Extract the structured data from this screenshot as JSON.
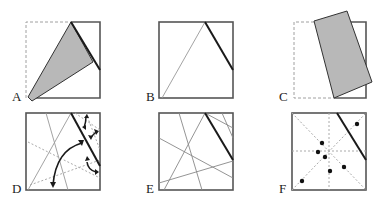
{
  "figure": {
    "panels": [
      {
        "id": "A",
        "label": "A",
        "description": "Square with dashed left/top-left portion; gray triangular flap folded from top edge point to bottom-left corner; thick crease on upper right"
      },
      {
        "id": "B",
        "label": "B",
        "description": "Square with thin diagonal line from bottom-left to top point and thick crease on upper right"
      },
      {
        "id": "C",
        "label": "C",
        "description": "Dashed square outline with gray quadrilateral flap rotated/folded over right side"
      },
      {
        "id": "D",
        "label": "D",
        "description": "Square with thin lines, dotted lines, thick crease and curved double-headed arrows"
      },
      {
        "id": "E",
        "label": "E",
        "description": "Square with multiple intersecting thin lines and a thick crease"
      },
      {
        "id": "F",
        "label": "F",
        "description": "Square with dotted center lines/diagonals, thick crease and seven dots"
      }
    ]
  },
  "colors": {
    "outline": "#555555",
    "crease": "#1a1a1a",
    "flap_fill": "#b8b8b8",
    "dashed": "#9a9a9a",
    "thin_line": "#8a8a8a",
    "dot": "#111111"
  }
}
